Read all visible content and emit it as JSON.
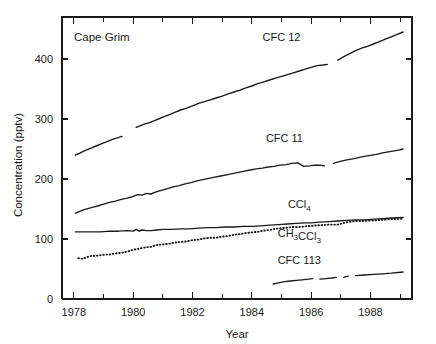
{
  "chart_data": {
    "type": "line",
    "title": "Cape Grim",
    "xlabel": "Year",
    "ylabel": "Concentration (pptv)",
    "xlim": [
      1977.6,
      1989.4
    ],
    "ylim": [
      0,
      470
    ],
    "grid": false,
    "legend_position": "inline-annotations",
    "y_ticks": [
      0,
      100,
      200,
      300,
      400
    ],
    "y_tick_labels": [
      "0",
      "100",
      "200",
      "300",
      "400"
    ],
    "x_ticks": [
      1978,
      1979,
      1980,
      1981,
      1982,
      1983,
      1984,
      1985,
      1986,
      1987,
      1988,
      1989
    ],
    "x_tick_labels": [
      "1978",
      "",
      "1980",
      "",
      "1982",
      "",
      "1984",
      "",
      "1986",
      "",
      "1988",
      ""
    ],
    "x_major_ticks": [
      1978,
      1980,
      1982,
      1984,
      1986,
      1988
    ],
    "series": [
      {
        "name": "CFC 12",
        "style": "solid",
        "label_x": 1985.0,
        "label_y": 430,
        "x": [
          1978.05,
          1978.2,
          1978.35,
          1978.45,
          1978.6,
          1978.75,
          1978.9,
          1979.05,
          1979.2,
          1979.35,
          1979.5,
          1979.62,
          1980.1,
          1980.25,
          1980.4,
          1980.55,
          1980.7,
          1980.85,
          1981.0,
          1981.2,
          1981.4,
          1981.6,
          1981.8,
          1982.0,
          1982.2,
          1982.4,
          1982.6,
          1982.8,
          1983.0,
          1983.2,
          1983.4,
          1983.6,
          1983.8,
          1984.0,
          1984.2,
          1984.4,
          1984.6,
          1984.8,
          1985.0,
          1985.2,
          1985.4,
          1985.6,
          1985.8,
          1986.0,
          1986.2,
          1986.4,
          1986.55,
          1986.9,
          1987.1,
          1987.3,
          1987.5,
          1987.7,
          1987.9,
          1988.1,
          1988.3,
          1988.5,
          1988.7,
          1988.9,
          1989.1
        ],
        "y": [
          240,
          243,
          247,
          249,
          252,
          255,
          258,
          261,
          264,
          267,
          269,
          271,
          286,
          289,
          292,
          294,
          297,
          300,
          303,
          307,
          311,
          315,
          318,
          322,
          326,
          329,
          332,
          335,
          338,
          342,
          345,
          348,
          352,
          355,
          359,
          362,
          365,
          368,
          371,
          374,
          377,
          380,
          383,
          386,
          389,
          390,
          391,
          398,
          404,
          409,
          414,
          418,
          421,
          425,
          429,
          433,
          437,
          441,
          445
        ],
        "gaps": [
          [
            1979.62,
            1980.1
          ],
          [
            1986.55,
            1986.9
          ]
        ]
      },
      {
        "name": "CFC 11",
        "style": "solid",
        "label_x": 1985.1,
        "label_y": 262,
        "x": [
          1978.05,
          1978.2,
          1978.35,
          1978.5,
          1978.65,
          1978.8,
          1979.0,
          1979.2,
          1979.4,
          1979.6,
          1979.8,
          1980.0,
          1980.15,
          1980.3,
          1980.45,
          1980.6,
          1980.75,
          1980.95,
          1981.15,
          1981.35,
          1981.55,
          1981.75,
          1981.95,
          1982.15,
          1982.35,
          1982.55,
          1982.75,
          1982.95,
          1983.15,
          1983.35,
          1983.55,
          1983.75,
          1983.95,
          1984.15,
          1984.35,
          1984.55,
          1984.75,
          1984.95,
          1985.15,
          1985.35,
          1985.55,
          1985.75,
          1985.95,
          1986.1,
          1986.3,
          1986.45,
          1986.75,
          1986.95,
          1987.2,
          1987.45,
          1987.7,
          1987.95,
          1988.2,
          1988.45,
          1988.7,
          1988.95,
          1989.1
        ],
        "y": [
          143,
          146,
          149,
          151,
          153,
          155,
          158,
          161,
          163,
          166,
          168,
          171,
          174,
          173,
          176,
          175,
          178,
          181,
          184,
          187,
          189,
          192,
          194,
          197,
          199,
          201,
          203,
          205,
          207,
          209,
          211,
          213,
          215,
          217,
          218,
          220,
          221,
          223,
          224,
          226,
          227,
          221,
          222,
          223,
          223,
          222,
          226,
          229,
          232,
          234,
          237,
          239,
          241,
          244,
          246,
          248,
          250
        ],
        "gaps": [
          [
            1986.45,
            1986.75
          ]
        ]
      },
      {
        "name": "CCl4",
        "label_html": "CCl<sub>4</sub>",
        "style": "solid",
        "label_x": 1985.6,
        "label_y": 152,
        "x": [
          1978.05,
          1978.3,
          1978.6,
          1978.9,
          1979.2,
          1979.5,
          1979.8,
          1980.0,
          1980.1,
          1980.2,
          1980.3,
          1980.45,
          1980.6,
          1980.8,
          1981.0,
          1981.3,
          1981.6,
          1981.9,
          1982.2,
          1982.5,
          1982.8,
          1983.1,
          1983.4,
          1983.7,
          1984.0,
          1984.3,
          1984.6,
          1984.9,
          1985.2,
          1985.5,
          1985.8,
          1986.0,
          1986.3,
          1986.6,
          1986.9,
          1987.2,
          1987.5,
          1987.8,
          1988.1,
          1988.4,
          1988.7,
          1989.1
        ],
        "y": [
          112,
          112,
          112,
          112,
          113,
          113,
          114,
          113,
          116,
          113,
          115,
          114,
          114,
          115,
          116,
          116,
          117,
          117,
          118,
          119,
          119,
          120,
          120,
          121,
          121,
          122,
          123,
          124,
          125,
          126,
          127,
          127,
          128,
          129,
          130,
          131,
          132,
          132,
          133,
          134,
          135,
          136
        ],
        "gaps": []
      },
      {
        "name": "CH3CCl3",
        "label_html": "CH<sub>3</sub>CCl<sub>3</sub>",
        "style": "dotted",
        "label_x": 1985.6,
        "label_y": 104,
        "x": [
          1978.15,
          1978.3,
          1978.45,
          1978.6,
          1978.75,
          1978.9,
          1979.05,
          1979.2,
          1979.4,
          1979.6,
          1979.8,
          1980.0,
          1980.2,
          1980.4,
          1980.6,
          1980.8,
          1981.0,
          1981.2,
          1981.4,
          1981.6,
          1981.8,
          1982.0,
          1982.2,
          1982.4,
          1982.6,
          1982.8,
          1983.0,
          1983.2,
          1983.4,
          1983.6,
          1983.8,
          1984.0,
          1984.2,
          1984.4,
          1984.6,
          1984.8,
          1985.0,
          1985.2,
          1985.4,
          1985.6,
          1985.8,
          1986.0,
          1986.3,
          1986.6,
          1986.9,
          1987.2,
          1987.5,
          1987.8,
          1988.1,
          1988.4,
          1988.7,
          1989.1
        ],
        "y": [
          68,
          67,
          70,
          72,
          72,
          73,
          74,
          74,
          76,
          77,
          79,
          82,
          84,
          86,
          87,
          90,
          91,
          92,
          94,
          95,
          96,
          98,
          99,
          101,
          102,
          102,
          104,
          105,
          107,
          108,
          110,
          111,
          112,
          114,
          115,
          117,
          118,
          119,
          120,
          120,
          121,
          122,
          123,
          124,
          124,
          128,
          130,
          130,
          131,
          132,
          133,
          134
        ],
        "gaps": []
      },
      {
        "name": "CFC 113",
        "style": "solid",
        "label_x": 1985.6,
        "label_y": 58,
        "x": [
          1984.72,
          1984.9,
          1985.1,
          1985.3,
          1985.5,
          1985.7,
          1985.9,
          1986.05,
          1986.3,
          1986.5,
          1986.7,
          1986.85,
          1987.1,
          1987.25,
          1987.5,
          1987.8,
          1988.1,
          1988.4,
          1988.7,
          1989.1
        ],
        "y": [
          25,
          27,
          29,
          30,
          31,
          32,
          33,
          34,
          33,
          34,
          35,
          36,
          36,
          38,
          39,
          40,
          41,
          42,
          43,
          45
        ],
        "gaps": [
          [
            1986.05,
            1986.3
          ],
          [
            1986.85,
            1987.1
          ],
          [
            1987.25,
            1987.5
          ]
        ]
      }
    ]
  }
}
